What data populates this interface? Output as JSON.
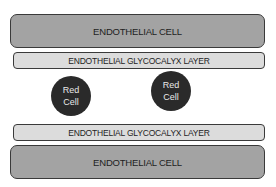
{
  "diagram": {
    "top_cell": {
      "label": "ENDOTHELIAL CELL"
    },
    "top_glycocalyx": {
      "label": "ENDOTHELIAL GLYCOCALYX LAYER"
    },
    "red_cells": [
      {
        "line1": "Red",
        "line2": "Cell"
      },
      {
        "line1": "Red",
        "line2": "Cell"
      }
    ],
    "bottom_glycocalyx": {
      "label": "ENDOTHELIAL GLYCOCALYX LAYER"
    },
    "bottom_cell": {
      "label": "ENDOTHELIAL CELL"
    },
    "colors": {
      "endothelial_cell": "#a3a3a3",
      "glycocalyx": "#dcdcdc",
      "red_cell": "#2a2a2a",
      "outline": "#3a3a3a"
    }
  }
}
